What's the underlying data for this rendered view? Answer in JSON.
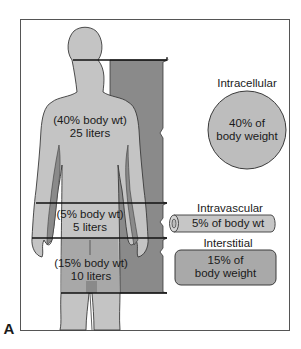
{
  "figure": {
    "panel_label": "A",
    "colors": {
      "frame": "#555555",
      "body_fill": "#c4c4c4",
      "shadow_fill": "#8a8a8a",
      "outline": "#3a3a3a",
      "divider_line": "#111111",
      "circle_fill": "#bdbdbd",
      "cylinder_fill": "#c6c6c6",
      "interstitial_fill": "#a9a9a9"
    }
  },
  "body_compartments": [
    {
      "id": "intracellular",
      "percent_label": "(40% body wt)",
      "volume_label": "25 liters"
    },
    {
      "id": "intravascular",
      "percent_label": "(5% body wt)",
      "volume_label": "5 liters"
    },
    {
      "id": "interstitial",
      "percent_label": "(15% body wt)",
      "volume_label": "10 liters"
    }
  ],
  "legend": {
    "intracellular": {
      "title": "Intracellular",
      "line1": "40% of",
      "line2": "body weight"
    },
    "intravascular": {
      "title": "Intravascular",
      "line1": "5% of body wt"
    },
    "interstitial": {
      "title": "Interstitial",
      "line1": "15% of",
      "line2": "body weight"
    }
  }
}
